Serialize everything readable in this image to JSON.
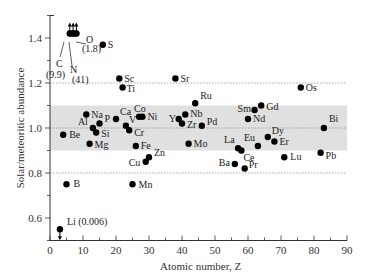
{
  "chart_data": {
    "type": "scatter",
    "title": "",
    "xlabel": "Atomic number, Z",
    "ylabel": "Solar/meteoritic abundance",
    "xlim": [
      0,
      90
    ],
    "ylim": [
      0.5,
      1.5
    ],
    "xticks": [
      0,
      10,
      20,
      30,
      40,
      50,
      60,
      70,
      80,
      90
    ],
    "yticks": [
      0.6,
      0.8,
      1.0,
      1.2,
      1.4
    ],
    "grid": false,
    "reference_lines": [
      0.8,
      1.0,
      1.2
    ],
    "shaded_band": [
      0.9,
      1.1
    ],
    "points": [
      {
        "el": "Li",
        "z": 3,
        "v": 0.55,
        "label": "Li (0.006)",
        "arrow": "down",
        "dx": 7,
        "dy": -4
      },
      {
        "el": "Be",
        "z": 4,
        "v": 0.97,
        "label": "Be",
        "dx": 6,
        "dy": 3
      },
      {
        "el": "B",
        "z": 5,
        "v": 0.75,
        "label": "B",
        "dx": 7,
        "dy": 3
      },
      {
        "el": "C",
        "z": 6,
        "v": 1.42,
        "label": "",
        "arrow": "up"
      },
      {
        "el": "N",
        "z": 7,
        "v": 1.42,
        "label": "",
        "arrow": "up"
      },
      {
        "el": "O",
        "z": 8,
        "v": 1.42,
        "label": "",
        "arrow": "up"
      },
      {
        "el": "Na",
        "z": 11,
        "v": 1.06,
        "label": "Na",
        "dx": 5,
        "dy": 0
      },
      {
        "el": "Mg",
        "z": 12,
        "v": 0.93,
        "label": "Mg",
        "dx": 5,
        "dy": 4
      },
      {
        "el": "Al",
        "z": 13,
        "v": 1.0,
        "label": "Al",
        "dx": -15,
        "dy": -3
      },
      {
        "el": "Si",
        "z": 14,
        "v": 0.98,
        "label": "Si",
        "dx": 5,
        "dy": 4
      },
      {
        "el": "P",
        "z": 15,
        "v": 1.02,
        "label": "P",
        "dx": 5,
        "dy": -2
      },
      {
        "el": "S",
        "z": 16,
        "v": 1.37,
        "label": "S",
        "dx": 5,
        "dy": 3
      },
      {
        "el": "Ca",
        "z": 20,
        "v": 1.04,
        "label": "Ca",
        "dx": 4,
        "dy": -4
      },
      {
        "el": "Sc",
        "z": 21,
        "v": 1.22,
        "label": "Sc",
        "dx": 5,
        "dy": 0
      },
      {
        "el": "Ti",
        "z": 22,
        "v": 1.18,
        "label": "Ti",
        "dx": 4,
        "dy": 4
      },
      {
        "el": "V",
        "z": 23,
        "v": 1.01,
        "label": "V",
        "dx": 3,
        "dy": -3
      },
      {
        "el": "Cr",
        "z": 24,
        "v": 0.99,
        "label": "Cr",
        "dx": 5,
        "dy": 6
      },
      {
        "el": "Mn",
        "z": 25,
        "v": 0.75,
        "label": "Mn",
        "dx": 6,
        "dy": 4
      },
      {
        "el": "Fe",
        "z": 26,
        "v": 0.92,
        "label": "Fe",
        "dx": 5,
        "dy": 3
      },
      {
        "el": "Co",
        "z": 27,
        "v": 1.05,
        "label": "Co",
        "dx": -5,
        "dy": -5
      },
      {
        "el": "Ni",
        "z": 28,
        "v": 1.05,
        "label": "Ni",
        "dx": 5,
        "dy": 0
      },
      {
        "el": "Cu",
        "z": 29,
        "v": 0.85,
        "label": "Cu",
        "dx": -17,
        "dy": 4
      },
      {
        "el": "Zn",
        "z": 30,
        "v": 0.87,
        "label": "Zn",
        "dx": 5,
        "dy": -1
      },
      {
        "el": "Sr",
        "z": 38,
        "v": 1.22,
        "label": "Sr",
        "dx": 5,
        "dy": 0
      },
      {
        "el": "Y",
        "z": 39,
        "v": 1.04,
        "label": "Y",
        "dx": -10,
        "dy": 3
      },
      {
        "el": "Zr",
        "z": 40,
        "v": 1.02,
        "label": "Zr",
        "dx": 5,
        "dy": 4
      },
      {
        "el": "Nb",
        "z": 41,
        "v": 1.06,
        "label": "Nb",
        "dx": 5,
        "dy": 2
      },
      {
        "el": "Mo",
        "z": 42,
        "v": 0.93,
        "label": "Mo",
        "dx": 5,
        "dy": 3
      },
      {
        "el": "Ru",
        "z": 44,
        "v": 1.11,
        "label": "Ru",
        "dx": 5,
        "dy": -4
      },
      {
        "el": "Pd",
        "z": 46,
        "v": 1.01,
        "label": "Pd",
        "dx": 5,
        "dy": -1
      },
      {
        "el": "Ba",
        "z": 56,
        "v": 0.84,
        "label": "Ba",
        "dx": -16,
        "dy": 2
      },
      {
        "el": "La",
        "z": 57,
        "v": 0.91,
        "label": "La",
        "dx": -14,
        "dy": -5
      },
      {
        "el": "Ce",
        "z": 58,
        "v": 0.9,
        "label": "Ce",
        "dx": 2,
        "dy": 10
      },
      {
        "el": "Pr",
        "z": 59,
        "v": 0.82,
        "label": "Pr",
        "dx": 4,
        "dy": -1
      },
      {
        "el": "Nd",
        "z": 60,
        "v": 1.04,
        "label": "Nd",
        "dx": 5,
        "dy": 3
      },
      {
        "el": "Sm",
        "z": 62,
        "v": 1.08,
        "label": "Sm",
        "dx": -17,
        "dy": 2
      },
      {
        "el": "Eu",
        "z": 63,
        "v": 0.92,
        "label": "Eu",
        "dx": -14,
        "dy": -5
      },
      {
        "el": "Gd",
        "z": 64,
        "v": 1.1,
        "label": "Gd",
        "dx": 5,
        "dy": 4
      },
      {
        "el": "Dy",
        "z": 66,
        "v": 0.96,
        "label": "Dy",
        "dx": 4,
        "dy": -3
      },
      {
        "el": "Er",
        "z": 68,
        "v": 0.94,
        "label": "Er",
        "dx": 5,
        "dy": 3
      },
      {
        "el": "Lu",
        "z": 71,
        "v": 0.87,
        "label": "Lu",
        "dx": 6,
        "dy": 3
      },
      {
        "el": "Os",
        "z": 76,
        "v": 1.18,
        "label": "Os",
        "dx": 5,
        "dy": 3
      },
      {
        "el": "Pb",
        "z": 82,
        "v": 0.89,
        "label": "Pb",
        "dx": 5,
        "dy": 6
      },
      {
        "el": "Bi",
        "z": 83,
        "v": 1.0,
        "label": "Bi",
        "dx": 5,
        "dy": -6
      }
    ],
    "annotations": [
      {
        "text": "C",
        "x": 6,
        "note": "line label"
      },
      {
        "text": "(9.9)",
        "x": 6
      },
      {
        "text": "N",
        "x": 7
      },
      {
        "text": "(41)",
        "x": 7
      },
      {
        "text": "O",
        "x": 8
      },
      {
        "text": "(1.8)",
        "x": 8
      }
    ]
  },
  "labels": {
    "c": "C",
    "c_val": "(9.9)",
    "n": "N",
    "n_val": "(41)",
    "o": "O",
    "o_val": "(1.8)"
  },
  "colors": {
    "band": "#e0e0e0",
    "dot": "#000000",
    "axis": "#333333",
    "refline": "#888888"
  }
}
